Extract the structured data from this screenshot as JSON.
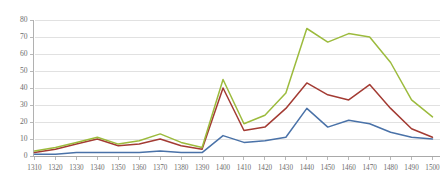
{
  "chart_data": {
    "type": "line",
    "title": "",
    "subtitle": "",
    "xlabel": "",
    "ylabel": "",
    "x": [
      1310,
      1320,
      1330,
      1340,
      1350,
      1360,
      1370,
      1380,
      1390,
      1400,
      1410,
      1420,
      1430,
      1440,
      1450,
      1460,
      1470,
      1480,
      1490,
      1500
    ],
    "xticklabels": [
      "1310",
      "1320",
      "1330",
      "1340",
      "1350",
      "1360",
      "1370",
      "1380",
      "1390",
      "1400",
      "1410",
      "1420",
      "1430",
      "1440",
      "1450",
      "1460",
      "1470",
      "1480",
      "1490",
      "1500"
    ],
    "yticks": [
      0,
      10,
      20,
      30,
      40,
      50,
      60,
      70,
      80
    ],
    "yticklabels": [
      "0",
      "10",
      "20",
      "30",
      "40",
      "50",
      "60",
      "70",
      "80"
    ],
    "ylim": [
      0,
      80
    ],
    "xlim": [
      1310,
      1500
    ],
    "grid": "horizontal",
    "legend": "none",
    "series": [
      {
        "name": "series-green",
        "color": "#9cbb3d",
        "values": [
          3,
          5,
          8,
          11,
          7,
          9,
          13,
          8,
          5,
          45,
          19,
          24,
          37,
          75,
          67,
          72,
          70,
          55,
          33,
          23
        ]
      },
      {
        "name": "series-red",
        "color": "#a33b33",
        "values": [
          2,
          4,
          7,
          10,
          6,
          7,
          10,
          6,
          4,
          40,
          15,
          17,
          28,
          43,
          36,
          33,
          42,
          28,
          16,
          11
        ]
      },
      {
        "name": "series-blue",
        "color": "#4a72a8",
        "values": [
          1,
          1,
          2,
          2,
          2,
          2,
          3,
          2,
          2,
          12,
          8,
          9,
          11,
          28,
          17,
          21,
          19,
          14,
          11,
          10
        ]
      }
    ]
  },
  "axis_style": {
    "tick_color": "#a8a8a8",
    "grid_color": "#d9d9d9",
    "axis_color": "#a8a8a8",
    "label_color": "#6d6d6d",
    "background": "#ffffff"
  }
}
